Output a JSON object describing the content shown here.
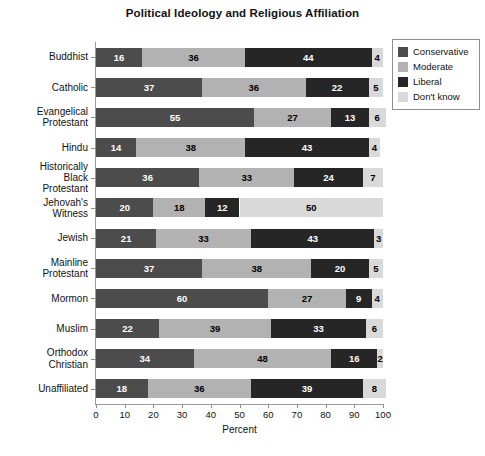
{
  "chart_data": {
    "type": "bar",
    "orientation": "horizontal",
    "stacked": true,
    "title": "Political Ideology and Religious Affiliation",
    "xlabel": "Percent",
    "ylabel": "",
    "xlim": [
      0,
      100
    ],
    "xticks": [
      0,
      10,
      20,
      30,
      40,
      50,
      60,
      70,
      80,
      90,
      100
    ],
    "xtick_labels": [
      "0",
      "10",
      "20",
      "30",
      "40",
      "50",
      "60",
      "70",
      "80",
      "90",
      "100"
    ],
    "grid": false,
    "legend_position": "right",
    "categories": [
      "Buddhist",
      "Catholic",
      "Evangelical Protestant",
      "Hindu",
      "Historically Black Protestant",
      "Jehovah's Witness",
      "Jewish",
      "Mainline Protestant",
      "Mormon",
      "Muslim",
      "Orthodox Christian",
      "Unaffiliated"
    ],
    "category_label_lines": [
      [
        "Buddhist"
      ],
      [
        "Catholic"
      ],
      [
        "Evangelical",
        "Protestant"
      ],
      [
        "Hindu"
      ],
      [
        "Historically",
        "Black",
        "Protestant"
      ],
      [
        "Jehovah's",
        "Witness"
      ],
      [
        "Jewish"
      ],
      [
        "Mainline",
        "Protestant"
      ],
      [
        "Mormon"
      ],
      [
        "Muslim"
      ],
      [
        "Orthodox",
        "Christian"
      ],
      [
        "Unaffiliated"
      ]
    ],
    "series": [
      {
        "name": "Conservative",
        "color": "#4c4c4c",
        "label_color": "#ffffff",
        "values": [
          16,
          37,
          55,
          14,
          36,
          20,
          21,
          37,
          60,
          22,
          34,
          18
        ]
      },
      {
        "name": "Moderate",
        "color": "#b2b2b2",
        "label_color": "#000000",
        "values": [
          36,
          36,
          27,
          38,
          33,
          18,
          33,
          38,
          27,
          39,
          48,
          36
        ]
      },
      {
        "name": "Liberal",
        "color": "#262626",
        "label_color": "#ffffff",
        "values": [
          44,
          22,
          13,
          43,
          24,
          12,
          43,
          20,
          9,
          33,
          16,
          39
        ]
      },
      {
        "name": "Don't know",
        "color": "#d9d9d9",
        "label_color": "#000000",
        "values": [
          4,
          5,
          6,
          4,
          7,
          50,
          3,
          5,
          4,
          6,
          2,
          8
        ]
      }
    ]
  }
}
